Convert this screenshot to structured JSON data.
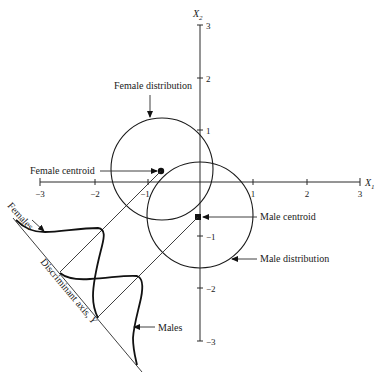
{
  "diagram": {
    "axes": {
      "x_label": "X",
      "x_sub": "1",
      "y_label": "X",
      "y_sub": "2",
      "x_ticks": [
        "−3",
        "−2",
        "−1",
        "1",
        "2",
        "3"
      ],
      "y_ticks": [
        "3",
        "2",
        "1",
        "−1",
        "−2",
        "−3"
      ]
    },
    "labels": {
      "female_distribution": "Female distribution",
      "female_centroid": "Female centroid",
      "male_centroid": "Male centroid",
      "male_distribution": "Male distribution",
      "females": "Females",
      "males": "Males",
      "discriminant_axis": "Discriminant axis, ",
      "discriminant_axis_var": "Y"
    },
    "colors": {
      "ink": "#1a1a1a",
      "background": "#ffffff"
    }
  }
}
